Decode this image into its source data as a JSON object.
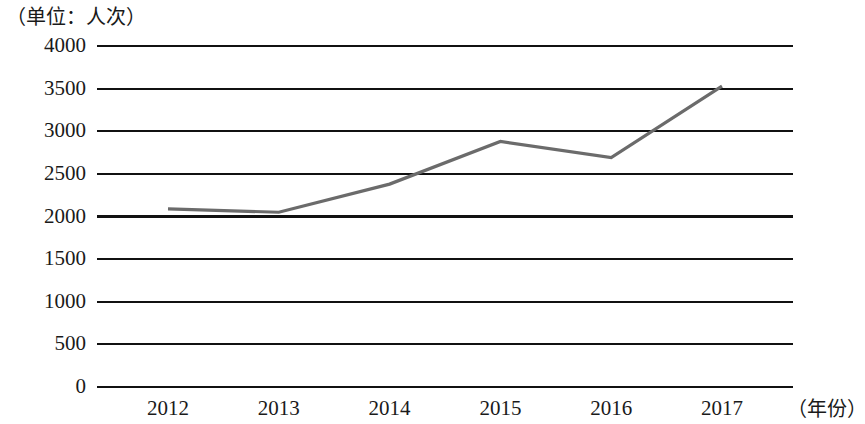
{
  "chart_data": {
    "type": "line",
    "title": "",
    "subtitle": "",
    "unit_caption": "（单位：人次）",
    "xlabel": "（年份）",
    "ylabel": "",
    "categories": [
      "2012",
      "2013",
      "2014",
      "2015",
      "2016",
      "2017"
    ],
    "series": [
      {
        "name": "人次",
        "values": [
          2090,
          2050,
          2380,
          2880,
          2690,
          3530
        ],
        "color": "#6b6b6b"
      }
    ],
    "ylim": [
      0,
      4000
    ],
    "ytick_values": [
      0,
      500,
      1000,
      1500,
      2000,
      2500,
      3000,
      3500,
      4000
    ],
    "ytick_labels": [
      "0",
      "500",
      "1000",
      "1500",
      "2000",
      "2500",
      "3000",
      "3500",
      "4000"
    ],
    "xtick_labels": [
      "2012",
      "2013",
      "2014",
      "2015",
      "2016",
      "2017"
    ],
    "grid": true,
    "grid_color": "#111111",
    "legend": false,
    "legend_position": "none",
    "markers": false,
    "background": "#ffffff"
  },
  "axis": {
    "unit_caption": "（单位：人次）",
    "xlabel": "（年份）"
  }
}
